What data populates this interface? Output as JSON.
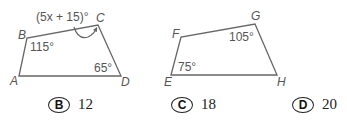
{
  "figures": [
    {
      "name": "quadrilateral-ABCD",
      "vertices": {
        "A": "A",
        "B": "B",
        "C": "C",
        "D": "D"
      },
      "angles": {
        "B": "115°",
        "D": "65°",
        "C": "(5x + 15)°"
      }
    },
    {
      "name": "quadrilateral-EFGH",
      "vertices": {
        "E": "E",
        "F": "F",
        "G": "G",
        "H": "H"
      },
      "angles": {
        "G": "105°",
        "E": "75°"
      }
    }
  ],
  "options": [
    {
      "letter": "B",
      "value": "12"
    },
    {
      "letter": "C",
      "value": "18"
    },
    {
      "letter": "D",
      "value": "20"
    }
  ]
}
